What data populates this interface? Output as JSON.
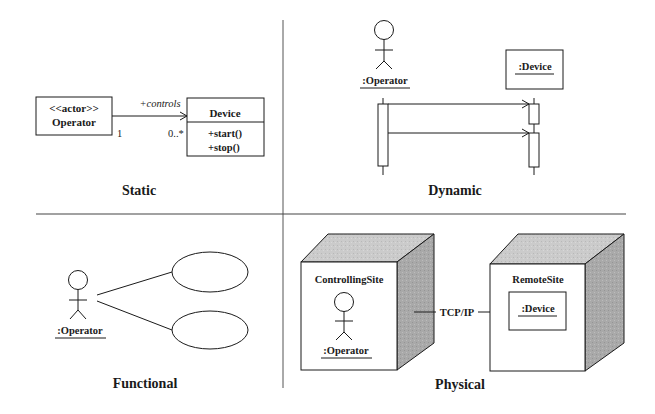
{
  "quadrants": {
    "static": {
      "title": "Static",
      "actor_class": {
        "stereotype": "<<actor>>",
        "name": "Operator"
      },
      "association": {
        "role": "+controls",
        "source_multiplicity": "1",
        "target_multiplicity": "0..*"
      },
      "device_class": {
        "name": "Device",
        "operations": [
          "+start()",
          "+stop()"
        ]
      }
    },
    "dynamic": {
      "title": "Dynamic",
      "actor_label": ":Operator",
      "object_label": ":Device"
    },
    "functional": {
      "title": "Functional",
      "actor_label": ":Operator",
      "use_case_count": 2
    },
    "physical": {
      "title": "Physical",
      "left_node": {
        "name": "ControllingSite",
        "actor_label": ":Operator"
      },
      "right_node": {
        "name": "RemoteSite",
        "component_label": ":Device"
      },
      "link_label": "TCP/IP"
    }
  },
  "colors": {
    "line": "#1a1a1a",
    "divider": "#555555",
    "cube_top": "#c8c8c8",
    "cube_side": "#a8a8a8",
    "background": "#ffffff"
  }
}
